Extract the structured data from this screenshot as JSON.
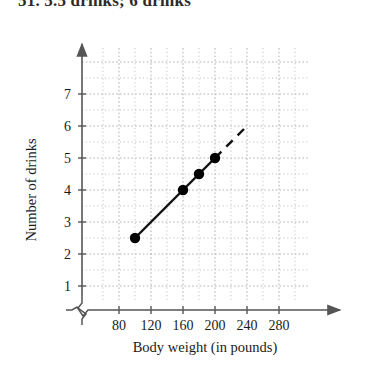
{
  "header": {
    "text": "51. 5.5 drinks; 6 drinks",
    "clipped": true
  },
  "chart_data": {
    "type": "line",
    "title": "",
    "xlabel": "Body weight (in pounds)",
    "ylabel": "Number of drinks",
    "xlim": [
      60,
      300
    ],
    "ylim": [
      0,
      7.8
    ],
    "xticks": [
      80,
      120,
      160,
      200,
      240,
      280
    ],
    "yticks": [
      1,
      2,
      3,
      4,
      5,
      6,
      7
    ],
    "grid": true,
    "grid_style": "dotted",
    "legend": "none",
    "axis_break_x": true,
    "axis_break_y": true,
    "series": [
      {
        "name": "observed",
        "style": "solid",
        "markers": true,
        "x": [
          100,
          160,
          180,
          200
        ],
        "y": [
          2.5,
          4,
          4.5,
          5
        ]
      },
      {
        "name": "extrapolation",
        "style": "dashed",
        "markers": false,
        "x": [
          200,
          240
        ],
        "y": [
          5,
          6
        ]
      }
    ],
    "colors": {
      "line": "#111111",
      "marker": "#000000",
      "grid": "#b9b9b9",
      "axis": "#555555"
    }
  }
}
